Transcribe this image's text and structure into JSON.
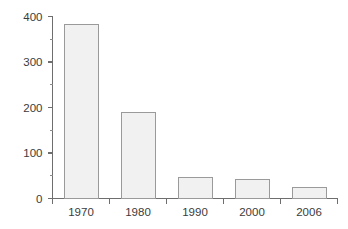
{
  "chart_data": {
    "type": "bar",
    "title": "",
    "subtitle": "",
    "xlabel": "",
    "ylabel": "",
    "categories": [
      "1970",
      "1980",
      "1990",
      "2000",
      "2006"
    ],
    "values": [
      382,
      189,
      46,
      42,
      24
    ],
    "series": [
      {
        "name": "",
        "values": [
          382,
          189,
          46,
          42,
          24
        ]
      }
    ],
    "ylim": [
      0,
      400
    ],
    "y_ticks": [
      0,
      100,
      200,
      300,
      400
    ],
    "y_tick_labels": [
      "0",
      "100",
      "200",
      "300",
      "400"
    ],
    "y_minor_ticks": [
      50,
      150,
      250,
      350
    ],
    "grid": false,
    "legend": false,
    "legend_position": "none",
    "bar_fill_color": "#f1f1f1",
    "bar_border_color": "#9a9a9a",
    "axis_color": "#6e6e6e",
    "text_color": "#3b3b3b",
    "background_color": "#ffffff"
  }
}
